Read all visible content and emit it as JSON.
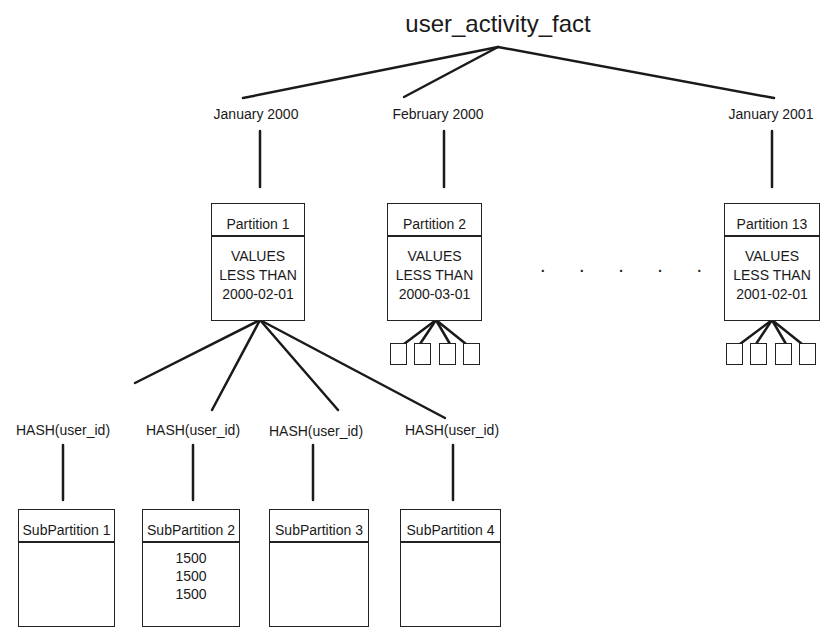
{
  "root": {
    "label": "user_activity_fact"
  },
  "range_partitions": [
    {
      "range_label": "January 2000",
      "name": "Partition 1",
      "bound": [
        "VALUES",
        "LESS THAN",
        "2000-02-01"
      ]
    },
    {
      "range_label": "February 2000",
      "name": "Partition 2",
      "bound": [
        "VALUES",
        "LESS THAN",
        "2000-03-01"
      ]
    },
    {
      "range_label": "January 2001",
      "name": "Partition 13",
      "bound": [
        "VALUES",
        "LESS THAN",
        "2001-02-01"
      ]
    }
  ],
  "ellipsis": ". . . . .",
  "subpartitions": [
    {
      "hash_label": "HASH(user_id)",
      "name": "SubPartition 1",
      "rows": []
    },
    {
      "hash_label": "HASH(user_id)",
      "name": "SubPartition 2",
      "rows": [
        "1500",
        "1500",
        "1500"
      ]
    },
    {
      "hash_label": "HASH(user_id)",
      "name": "SubPartition 3",
      "rows": []
    },
    {
      "hash_label": "HASH(user_id)",
      "name": "SubPartition 4",
      "rows": []
    }
  ]
}
